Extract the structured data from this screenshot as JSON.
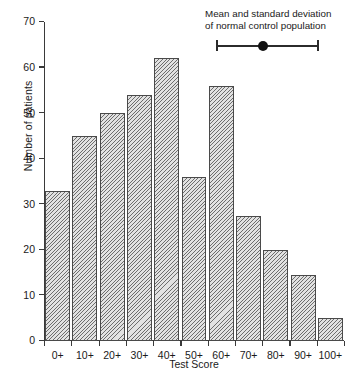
{
  "chart_data": {
    "type": "bar",
    "title": "",
    "xlabel": "Test Score",
    "ylabel": "Number of patients",
    "categories": [
      "0+",
      "10+",
      "20+",
      "30+",
      "40+",
      "50+",
      "60+",
      "70+",
      "80+",
      "90+",
      "100+"
    ],
    "values": [
      33,
      45,
      50,
      54,
      62,
      36,
      56,
      27.5,
      20,
      14.5,
      5
    ],
    "ylim": [
      0,
      70
    ],
    "yticks": [
      0,
      10,
      20,
      30,
      40,
      50,
      60,
      70
    ],
    "ytick_labels": [
      "0",
      "10",
      "20",
      "30",
      "40",
      "50",
      "60",
      "70"
    ],
    "grid": false,
    "legend_position": "top-right",
    "bar_fill": "#e2e2e2",
    "bar_edge": "#4a4a4a",
    "bar_hatch": "diagonal",
    "annotations": [
      {
        "name": "normal-control-marker",
        "text_lines": [
          "Mean and standard deviation",
          "of normal control population"
        ],
        "marker": "error-bar-with-mean-dot",
        "marker_color": "#2b2b2b"
      }
    ]
  },
  "axes": {
    "y_title": "Number of patients",
    "x_title": "Test Score"
  },
  "annotation": {
    "line1": "Mean and standard deviation",
    "line2": "of normal control population"
  }
}
